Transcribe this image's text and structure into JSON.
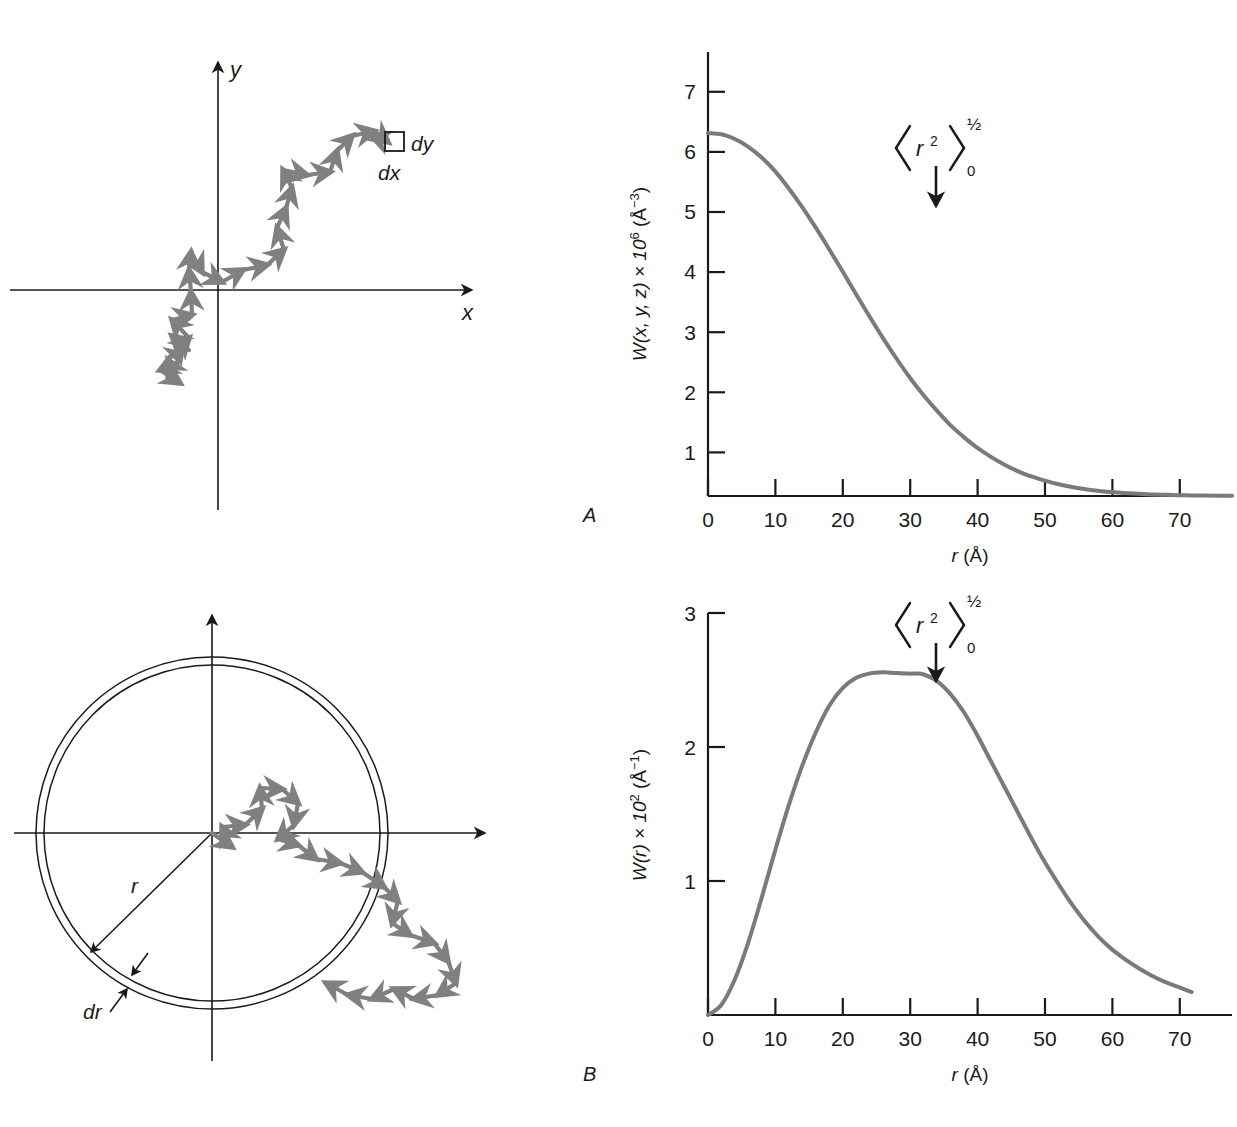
{
  "figure": {
    "panels": [
      {
        "id": "A",
        "label": "A"
      },
      {
        "id": "B",
        "label": "B"
      }
    ]
  },
  "walk_diagram": {
    "name": "cartesian-random-walk",
    "axis_labels": {
      "x": "x",
      "y": "y"
    },
    "element_labels": {
      "dx": "dx",
      "dy": "dy"
    },
    "arrow_color": "#808080",
    "axis_color": "#1a1a1a"
  },
  "circle_diagram": {
    "name": "radial-shell-random-walk",
    "labels": {
      "r": "r",
      "dr": "dr"
    },
    "arrow_color": "#808080",
    "axis_color": "#1a1a1a"
  },
  "chart_data": [
    {
      "type": "line",
      "panel": "A",
      "title": "",
      "xlabel": "r (Å)",
      "ylabel": "W(x, y, z) × 10⁶ (Å⁻³)",
      "ylabel_parts": {
        "prefix": "W(x, y, z) × 10",
        "exp1": "6",
        "mid": " (Å",
        "exp2": "−3",
        "suffix": ")"
      },
      "xlabel_parts": {
        "sym": "r",
        "unit": " (Å)"
      },
      "xlim": [
        0,
        78
      ],
      "ylim": [
        0,
        7.4
      ],
      "xticks": [
        0,
        10,
        20,
        30,
        40,
        50,
        60,
        70
      ],
      "yticks": [
        1,
        2,
        3,
        4,
        5,
        6,
        7
      ],
      "xticklabels": [
        "0",
        "10",
        "20",
        "30",
        "40",
        "50",
        "60",
        "70"
      ],
      "yticklabels": [
        "1",
        "2",
        "3",
        "4",
        "5",
        "6",
        "7"
      ],
      "grid": false,
      "legend": "none",
      "curve_color": "#7a7a7a",
      "annotation": {
        "text": "⟨r²⟩₀^½",
        "bra": "⟨",
        "ket": "⟩",
        "base": "r",
        "base_exp": "2",
        "sup": "½",
        "sub": "0",
        "arrow": "down-arrow",
        "x_value": 38
      },
      "x": [
        0,
        2,
        4,
        6,
        8,
        10,
        12,
        14,
        16,
        18,
        20,
        22,
        24,
        26,
        28,
        30,
        32,
        34,
        36,
        38,
        40,
        42,
        44,
        46,
        48,
        50,
        52,
        54,
        56,
        58,
        60,
        62,
        64,
        66,
        68,
        70,
        72,
        74,
        76,
        78
      ],
      "values": [
        6.05,
        6.03,
        5.95,
        5.82,
        5.64,
        5.41,
        5.13,
        4.82,
        4.48,
        4.12,
        3.75,
        3.37,
        3.0,
        2.64,
        2.3,
        1.98,
        1.69,
        1.43,
        1.19,
        0.99,
        0.81,
        0.66,
        0.53,
        0.42,
        0.33,
        0.26,
        0.2,
        0.155,
        0.118,
        0.089,
        0.067,
        0.05,
        0.037,
        0.027,
        0.02,
        0.014,
        0.01,
        0.007,
        0.005,
        0.003
      ]
    },
    {
      "type": "line",
      "panel": "B",
      "title": "",
      "xlabel": "r (Å)",
      "ylabel": "W(r) × 10² (Å⁻¹)",
      "ylabel_parts": {
        "prefix": "W(r) × 10",
        "exp1": "2",
        "mid": " (Å",
        "exp2": "−1",
        "suffix": ")"
      },
      "xlabel_parts": {
        "sym": "r",
        "unit": " (Å)"
      },
      "xlim": [
        0,
        78
      ],
      "ylim": [
        0,
        3.15
      ],
      "xticks": [
        0,
        10,
        20,
        30,
        40,
        50,
        60,
        70
      ],
      "yticks": [
        1,
        2,
        3
      ],
      "xticklabels": [
        "0",
        "10",
        "20",
        "30",
        "40",
        "50",
        "60",
        "70"
      ],
      "yticklabels": [
        "1",
        "2",
        "3"
      ],
      "grid": false,
      "legend": "none",
      "curve_color": "#7a7a7a",
      "annotation": {
        "text": "⟨r²⟩₀^½",
        "bra": "⟨",
        "ket": "⟩",
        "base": "r",
        "base_exp": "2",
        "sup": "½",
        "sub": "0",
        "arrow": "down-arrow",
        "x_value": 38
      },
      "peak": {
        "x": 31,
        "y": 2.68
      },
      "x": [
        0,
        2,
        4,
        6,
        8,
        10,
        12,
        14,
        16,
        18,
        20,
        22,
        24,
        26,
        28,
        30,
        31,
        32,
        34,
        36,
        38,
        40,
        42,
        44,
        46,
        48,
        50,
        52,
        54,
        56,
        58,
        60,
        62,
        64,
        66,
        68,
        70,
        72
      ],
      "values": [
        0.0,
        0.08,
        0.28,
        0.57,
        0.92,
        1.29,
        1.64,
        1.95,
        2.21,
        2.42,
        2.56,
        2.64,
        2.675,
        2.685,
        2.68,
        2.675,
        2.675,
        2.67,
        2.62,
        2.52,
        2.38,
        2.2,
        2.0,
        1.8,
        1.6,
        1.4,
        1.21,
        1.04,
        0.88,
        0.74,
        0.62,
        0.52,
        0.44,
        0.37,
        0.31,
        0.26,
        0.22,
        0.18
      ]
    }
  ]
}
